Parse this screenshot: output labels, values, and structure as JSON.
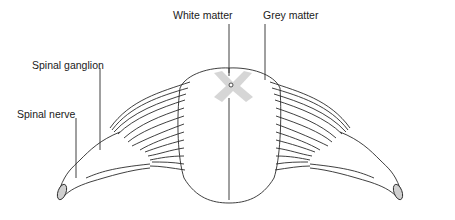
{
  "diagram": {
    "labels": {
      "white_matter": "White matter",
      "grey_matter": "Grey matter",
      "spinal_ganglion": "Spinal ganglion",
      "spinal_nerve": "Spinal nerve"
    },
    "colors": {
      "line": "#2a2a2a",
      "grey_matter_fill": "#cfcfcf",
      "background": "#ffffff"
    }
  }
}
